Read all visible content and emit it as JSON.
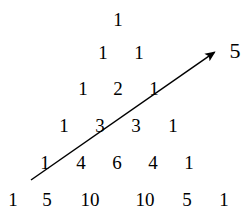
{
  "figure": {
    "background_color": "#ffffff",
    "ink_color": "#000000"
  },
  "chart_data": {
    "type": "table",
    "xlabel": "",
    "ylabel": "",
    "rows": [
      {
        "index": 0,
        "values": [
          "1"
        ]
      },
      {
        "index": 1,
        "values": [
          "1",
          "1"
        ]
      },
      {
        "index": 2,
        "values": [
          "1",
          "2",
          "1"
        ]
      },
      {
        "index": 3,
        "values": [
          "1",
          "3",
          "3",
          "1"
        ]
      },
      {
        "index": 4,
        "values": [
          "1",
          "4",
          "6",
          "4",
          "1"
        ]
      },
      {
        "index": 5,
        "values": [
          "1",
          "5",
          "10",
          "10",
          "5",
          "1"
        ]
      }
    ],
    "annotations": [
      {
        "name": "diagonal-arrow",
        "kind": "arrow",
        "label": "5",
        "from": [
          31,
          180
        ],
        "to": [
          222,
          47
        ],
        "crosses_values": [
          "1",
          "3",
          "1"
        ],
        "sum": "5"
      }
    ],
    "grid": false,
    "legend": "none"
  },
  "positions": {
    "row_y": [
      19,
      52,
      88,
      125,
      162,
      199
    ],
    "cells": [
      {
        "text": "1",
        "x": 118,
        "y": 19
      },
      {
        "text": "1",
        "x": 103,
        "y": 52
      },
      {
        "text": "1",
        "x": 139,
        "y": 52
      },
      {
        "text": "1",
        "x": 83,
        "y": 88
      },
      {
        "text": "2",
        "x": 118,
        "y": 88
      },
      {
        "text": "1",
        "x": 154,
        "y": 88
      },
      {
        "text": "1",
        "x": 64,
        "y": 125
      },
      {
        "text": "3",
        "x": 100,
        "y": 125
      },
      {
        "text": "3",
        "x": 136,
        "y": 125
      },
      {
        "text": "1",
        "x": 173,
        "y": 125
      },
      {
        "text": "1",
        "x": 45,
        "y": 162
      },
      {
        "text": "4",
        "x": 81,
        "y": 162
      },
      {
        "text": "6",
        "x": 117,
        "y": 162
      },
      {
        "text": "4",
        "x": 153,
        "y": 162
      },
      {
        "text": "1",
        "x": 189,
        "y": 162
      },
      {
        "text": "1",
        "x": 13,
        "y": 199
      },
      {
        "text": "5",
        "x": 47,
        "y": 199
      },
      {
        "text": "10",
        "x": 90,
        "y": 199
      },
      {
        "text": "10",
        "x": 145,
        "y": 199
      },
      {
        "text": "5",
        "x": 187,
        "y": 199
      },
      {
        "text": "1",
        "x": 224,
        "y": 199
      }
    ],
    "arrow_label": {
      "text": "5",
      "x": 235,
      "y": 51
    }
  }
}
